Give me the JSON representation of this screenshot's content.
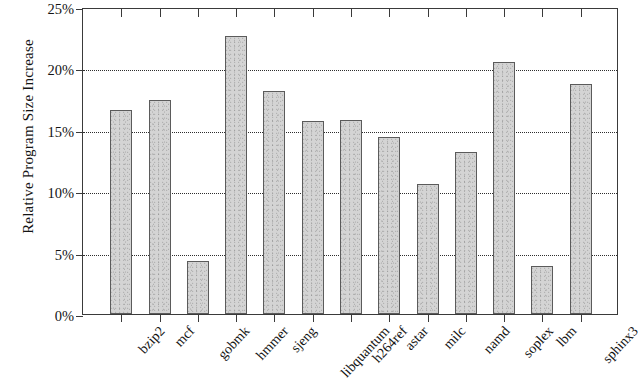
{
  "chart_data": {
    "type": "bar",
    "title": "",
    "xlabel": "",
    "ylabel": "Relative Program Size Increase",
    "categories": [
      "bzip2",
      "mcf",
      "gobmk",
      "hmmer",
      "sjeng",
      "libquantum",
      "h264ref",
      "astar",
      "milc",
      "namd",
      "soplex",
      "lbm",
      "sphinx3"
    ],
    "values": [
      16.6,
      17.4,
      4.35,
      22.6,
      18.2,
      15.7,
      15.8,
      14.4,
      10.6,
      13.2,
      20.5,
      3.9,
      18.7
    ],
    "value_unit": "%",
    "ylim": [
      0,
      25
    ],
    "ytick_values": [
      0,
      5,
      10,
      15,
      20,
      25
    ],
    "ytick_labels": [
      "0%",
      "5%",
      "10%",
      "15%",
      "20%",
      "25%"
    ],
    "gridlines": [
      5,
      10,
      15,
      20
    ],
    "grid": true,
    "grid_style": "dotted",
    "legend": null,
    "bar_fill_color": "#d4d4d4",
    "bar_edge_color": "#5b5b5b",
    "axis_color": "#3a3a3a",
    "background_color": "#ffffff"
  }
}
